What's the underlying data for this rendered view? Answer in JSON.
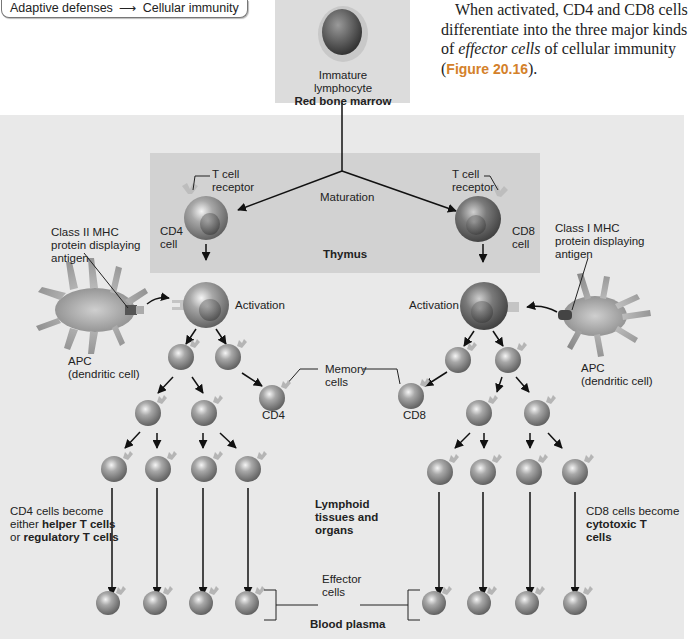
{
  "breadcrumb": {
    "left": "Adaptive defenses",
    "arrow_icon": "right-arrow-icon",
    "right": "Cellular immunity"
  },
  "paragraph": {
    "text_1": "When activated, CD4 and CD8 cells differentiate into the three major kinds of ",
    "emphasis": "effector cells",
    "text_2": " of cellular immunity (",
    "figure_ref": "Figure 20.16",
    "text_3": ")."
  },
  "figure": {
    "immature_label_1": "Immature",
    "immature_label_2": "lymphocyte",
    "red_bone_marrow": "Red bone marrow",
    "maturation": "Maturation",
    "thymus": "Thymus",
    "tcr_left_1": "T cell",
    "tcr_left_2": "receptor",
    "tcr_right_1": "T cell",
    "tcr_right_2": "receptor",
    "cd4_cell_1": "CD4",
    "cd4_cell_2": "cell",
    "cd8_cell_1": "CD8",
    "cd8_cell_2": "cell",
    "mhc2_1": "Class II MHC",
    "mhc2_2": "protein displaying",
    "mhc2_3": "antigen",
    "mhc1_1": "Class I MHC",
    "mhc1_2": "protein displaying",
    "mhc1_3": "antigen",
    "activation_left": "Activation",
    "activation_right": "Activation",
    "apc_left_1": "APC",
    "apc_left_2": "(dendritic cell)",
    "apc_right_1": "APC",
    "apc_right_2": "(dendritic cell)",
    "memory_1": "Memory",
    "memory_2": "cells",
    "memory_cd4": "CD4",
    "memory_cd8": "CD8",
    "lymphoid_1": "Lymphoid",
    "lymphoid_2": "tissues and",
    "lymphoid_3": "organs",
    "cd4_become_1": "CD4 cells become",
    "cd4_become_2a": "either ",
    "cd4_become_2b": "helper T cells",
    "cd4_become_3a": "or ",
    "cd4_become_3b": "regulatory T cells",
    "cd8_become_1": "CD8 cells become",
    "cd8_become_2": "cytotoxic T",
    "cd8_become_3": "cells",
    "effector_1": "Effector",
    "effector_2": "cells",
    "blood_plasma": "Blood plasma"
  },
  "colors": {
    "figure_ref": "#d4812a",
    "outer_bg": "#e9e9e9",
    "thymus_bg": "#d2d2d2",
    "marrow_bg": "#dcdcdc"
  }
}
